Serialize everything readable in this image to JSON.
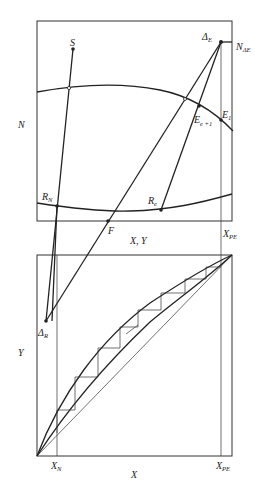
{
  "figure": {
    "top_panel": {
      "y_axis_label": "N",
      "x_axis_label": "X, Y",
      "points": {
        "S": "S",
        "delta_E": "Δ",
        "delta_E_sub": "E",
        "N_delta_E": "N",
        "N_delta_E_sub": "ΔE",
        "E_e1": "E",
        "E_e1_sub": "e +1",
        "E_1": "E",
        "E_1_sub": "1",
        "R_N": "R",
        "R_N_sub": "N",
        "R_e": "R",
        "R_e_sub": "e",
        "F": "F",
        "X_PE": "X",
        "X_PE_sub": "PE"
      }
    },
    "bottom_panel": {
      "y_axis_label": "Y",
      "x_axis_label": "X",
      "points": {
        "delta_R": "Δ",
        "delta_R_sub": "R",
        "X_N": "X",
        "X_N_sub": "N",
        "X_PE": "X",
        "X_PE_sub": "PE"
      }
    }
  }
}
